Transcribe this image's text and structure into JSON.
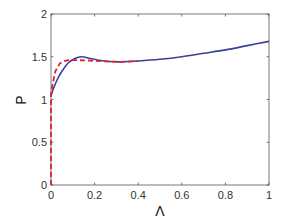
{
  "chart_data": {
    "type": "line",
    "title": "",
    "xlabel": "Λ",
    "ylabel": "P",
    "xlim": [
      0,
      1
    ],
    "ylim": [
      0,
      2
    ],
    "xticks": [
      "0",
      "0.2",
      "0.4",
      "0.6",
      "0.8",
      "1"
    ],
    "yticks": [
      "0",
      "0.5",
      "1",
      "1.5",
      "2"
    ],
    "grid": false,
    "legend": null,
    "series": [
      {
        "name": "solid",
        "color": "#3a3f9a",
        "style": "solid",
        "x": [
          0,
          0.01,
          0.03,
          0.05,
          0.08,
          0.11,
          0.14,
          0.18,
          0.22,
          0.27,
          0.32,
          0.4,
          0.5,
          0.6,
          0.7,
          0.8,
          0.9,
          1.0
        ],
        "y": [
          1.04,
          1.12,
          1.24,
          1.33,
          1.43,
          1.48,
          1.5,
          1.48,
          1.46,
          1.445,
          1.44,
          1.45,
          1.47,
          1.5,
          1.54,
          1.58,
          1.63,
          1.68
        ]
      },
      {
        "name": "dashed",
        "color": "#e0202a",
        "style": "dashed",
        "x": [
          0,
          0,
          0.005,
          0.02,
          0.04,
          0.06,
          0.08,
          0.12,
          0.18,
          0.25,
          0.32,
          0.4
        ],
        "y": [
          0,
          1.05,
          1.15,
          1.33,
          1.42,
          1.45,
          1.46,
          1.46,
          1.455,
          1.445,
          1.44,
          1.45
        ]
      }
    ]
  }
}
